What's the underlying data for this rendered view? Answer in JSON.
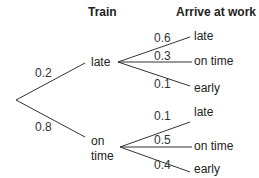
{
  "headers": {
    "train": "Train",
    "arrive": "Arrive at work"
  },
  "level1": [
    {
      "label": "late",
      "prob": "0.2"
    },
    {
      "label_line1": "on",
      "label_line2": "time",
      "prob": "0.8"
    }
  ],
  "level2": {
    "late": [
      {
        "label": "late",
        "prob": "0.6"
      },
      {
        "label": "on time",
        "prob": "0.3"
      },
      {
        "label": "early",
        "prob": "0.1"
      }
    ],
    "on_time": [
      {
        "label": "late",
        "prob": "0.1"
      },
      {
        "label": "on time",
        "prob": "0.5"
      },
      {
        "label": "early",
        "prob": "0.4"
      }
    ]
  }
}
